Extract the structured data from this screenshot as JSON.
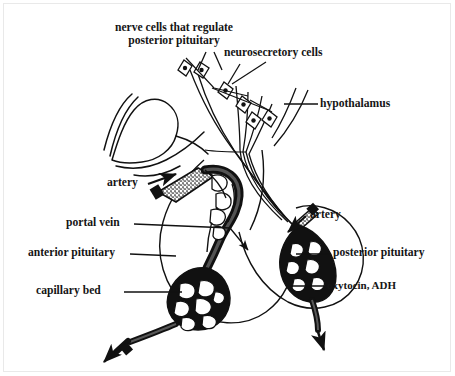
{
  "figure": {
    "type": "anatomical-diagram",
    "line_color": "#111111",
    "background_color": "#ffffff",
    "frame_color": "#e9e9e9"
  },
  "labels": {
    "nerve_cells": {
      "line1": "nerve cells that regulate",
      "line2": "posterior pituitary"
    },
    "neurosecretory_cells": "neurosecretory cells",
    "hypothalamus": "hypothalamus",
    "artery_left": "artery",
    "artery_right": "artery",
    "portal_vein": "portal vein",
    "anterior_pituitary": "anterior pituitary",
    "capillary_bed": "capillary bed",
    "posterior_pituitary": "posterior pituitary",
    "oxytocin_adh": "oxytocin, ADH"
  },
  "structures": {
    "brain_outline": "hypothalamus and optic chiasm contour",
    "anterior_lobe": "anterior pituitary lobe circle",
    "posterior_lobe": "posterior pituitary lobe circle",
    "portal_system": "hypophyseal portal vessel network",
    "capillary_plexus_anterior": "anterior capillary bed mesh",
    "capillary_plexus_posterior": "posterior capillary bed mesh",
    "axon_bundle": "neurosecretory axon tract",
    "cell_bodies_count": 6
  }
}
